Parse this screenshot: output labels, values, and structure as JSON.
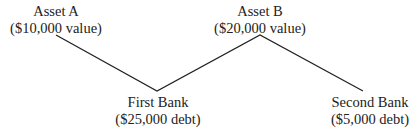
{
  "diagram": {
    "nodes": [
      {
        "id": "asset-a",
        "name": "Asset A",
        "detail": "($10,000 value)"
      },
      {
        "id": "first-bank",
        "name": "First Bank",
        "detail": "($25,000 debt)"
      },
      {
        "id": "asset-b",
        "name": "Asset B",
        "detail": "($20,000 value)"
      },
      {
        "id": "second-bank",
        "name": "Second Bank",
        "detail": "($5,000 debt)"
      }
    ],
    "edges": [
      {
        "from": "asset-a",
        "to": "first-bank"
      },
      {
        "from": "first-bank",
        "to": "asset-b"
      },
      {
        "from": "asset-b",
        "to": "second-bank"
      }
    ]
  }
}
